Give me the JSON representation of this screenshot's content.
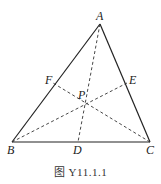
{
  "figure": {
    "caption": "图 Y11.1.1",
    "points": {
      "A": {
        "label": "A",
        "x": 100,
        "y": 24
      },
      "B": {
        "label": "B",
        "x": 12,
        "y": 142
      },
      "C": {
        "label": "C",
        "x": 150,
        "y": 142
      },
      "D": {
        "label": "D",
        "x": 78,
        "y": 142
      },
      "E": {
        "label": "E",
        "x": 127,
        "y": 83
      },
      "F": {
        "label": "F",
        "x": 53,
        "y": 83
      },
      "P": {
        "label": "P",
        "x": 85,
        "y": 104
      }
    },
    "solid_segments": [
      "AB",
      "BC",
      "CA"
    ],
    "dashed_segments": [
      "AD",
      "BE",
      "CF"
    ],
    "colors": {
      "line": "#222222",
      "background": "#ffffff"
    }
  }
}
